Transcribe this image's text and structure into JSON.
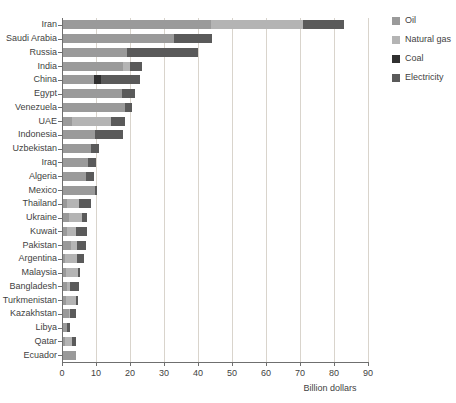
{
  "chart_data": {
    "type": "bar",
    "orientation": "horizontal",
    "stacked": true,
    "title": "",
    "xlabel": "Billion dollars",
    "ylabel": "",
    "xlim": [
      0,
      90
    ],
    "xticks": [
      0,
      10,
      20,
      30,
      40,
      50,
      60,
      70,
      80,
      90
    ],
    "grid": true,
    "legend_position": "right",
    "categories": [
      "Iran",
      "Saudi Arabia",
      "Russia",
      "India",
      "China",
      "Egypt",
      "Venezuela",
      "UAE",
      "Indonesia",
      "Uzbekistan",
      "Iraq",
      "Algeria",
      "Mexico",
      "Thailand",
      "Ukraine",
      "Kuwait",
      "Pakistan",
      "Argentina",
      "Malaysia",
      "Bangladesh",
      "Turkmenistan",
      "Kazakhstan",
      "Libya",
      "Qatar",
      "Ecuador"
    ],
    "series": [
      {
        "name": "Oil",
        "color": "#9a9a9a",
        "values": [
          43.8,
          33.0,
          19.0,
          18.0,
          9.5,
          17.5,
          18.5,
          3.0,
          9.8,
          8.5,
          7.5,
          7.0,
          9.8,
          1.5,
          2.0,
          1.5,
          2.5,
          1.0,
          1.2,
          1.5,
          1.2,
          2.0,
          1.5,
          1.0,
          4.0
        ]
      },
      {
        "name": "Natural gas",
        "color": "#b4b4b4",
        "values": [
          27.2,
          0.0,
          0.0,
          2.0,
          0.0,
          0.0,
          0.0,
          11.5,
          0.0,
          0.0,
          0.0,
          0.0,
          0.0,
          3.5,
          4.0,
          2.5,
          2.0,
          3.5,
          3.5,
          1.0,
          3.0,
          0.5,
          0.0,
          2.0,
          0.0
        ]
      },
      {
        "name": "Coal",
        "color": "#303030",
        "values": [
          0.0,
          0.0,
          0.0,
          0.0,
          2.0,
          0.0,
          0.0,
          0.0,
          0.0,
          0.0,
          0.0,
          0.0,
          0.0,
          0.0,
          0.0,
          0.0,
          0.0,
          0.0,
          0.0,
          0.0,
          0.0,
          0.0,
          0.0,
          0.0,
          0.0
        ]
      },
      {
        "name": "Electricity",
        "color": "#5a5a5a",
        "values": [
          12.0,
          11.0,
          21.0,
          3.5,
          11.5,
          4.0,
          2.0,
          4.0,
          8.0,
          2.5,
          2.5,
          2.5,
          0.5,
          3.5,
          1.5,
          3.5,
          2.5,
          2.0,
          0.5,
          2.5,
          0.5,
          1.5,
          1.0,
          1.0,
          0.0
        ]
      }
    ]
  },
  "legend": {
    "items": [
      {
        "label": "Oil",
        "color": "#9a9a9a"
      },
      {
        "label": "Natural gas",
        "color": "#b4b4b4"
      },
      {
        "label": "Coal",
        "color": "#303030"
      },
      {
        "label": "Electricity",
        "color": "#5a5a5a"
      }
    ]
  },
  "axis": {
    "x_title": "Billion dollars"
  }
}
